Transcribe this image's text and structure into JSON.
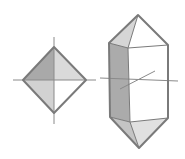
{
  "diagram": {
    "title": "",
    "colors": {
      "edge": "#7a7a7a",
      "axis": "#8a8a8a",
      "face_dark": "#a8a8a8",
      "face_mid": "#cfcfcf",
      "face_light": "#e4e4e4",
      "face_white": "#ffffff"
    },
    "shapes": [
      {
        "name": "octahedron",
        "label": ""
      },
      {
        "name": "hexagonal-prism-bipyramid",
        "label": ""
      }
    ]
  }
}
